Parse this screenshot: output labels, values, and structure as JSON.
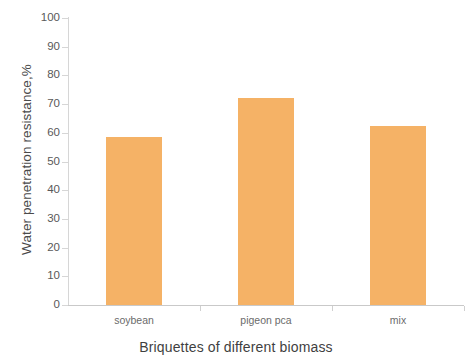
{
  "chart_data": {
    "type": "bar",
    "title": "",
    "categories": [
      "soybean",
      "pigeon pca",
      "mix"
    ],
    "values": [
      58.5,
      72,
      62.5
    ],
    "xlabel": "Briquettes of different biomass",
    "ylabel": "Water penetration resistance,%",
    "ylim": [
      0,
      100
    ],
    "ytick_labels": [
      "100",
      "90",
      "80",
      "70",
      "60",
      "50",
      "40",
      "30",
      "20",
      "10",
      "0"
    ],
    "ytick_values": [
      100,
      90,
      80,
      70,
      60,
      50,
      40,
      30,
      20,
      10,
      0
    ],
    "series": [
      {
        "name": "Water penetration resistance",
        "values": [
          58.5,
          72,
          62.5
        ]
      }
    ],
    "grid": false,
    "legend": false,
    "legend_position": "none",
    "bar_color": "#f5b266",
    "axis_color": "#d0d0d0",
    "background_color": "#ffffff"
  },
  "axes": {
    "y_title": "Water penetration resistance,%",
    "x_title": "Briquettes of different biomass"
  }
}
